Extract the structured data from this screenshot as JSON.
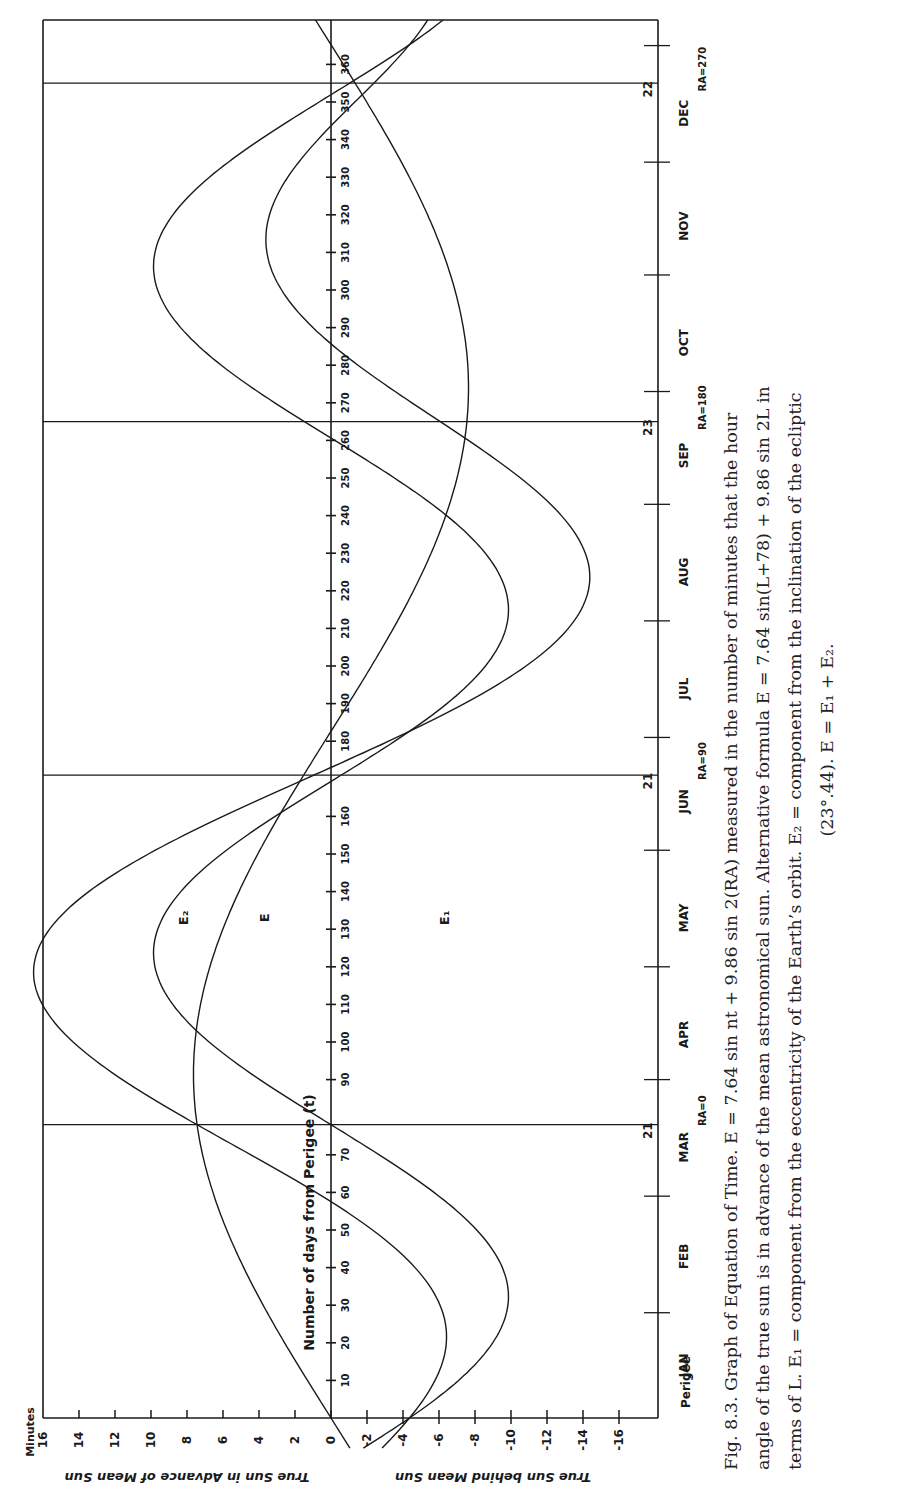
{
  "figure": {
    "label": "Fig. 8.3.",
    "title": "Graph of Equation of Time.",
    "caption_lines": [
      "Fig. 8.3.  Graph of Equation of Time.    E = 7.64 sin nt + 9.86 sin 2(RA) measured in the number of minutes that the hour",
      "angle of the true sun is in advance of the mean astronomical sun. Alternative formula   E = 7.64 sin(L+78) + 9.86 sin 2L in",
      "terms of L. E₁ = component from the eccentricity of the Earth’s orbit. E₂ = component from the inclination of the ecliptic",
      "(23°.44).  E = E₁ + E₂."
    ]
  },
  "axes": {
    "minutes_label": "Minutes",
    "minutes_ticks": [
      16,
      14,
      12,
      10,
      8,
      6,
      4,
      2,
      0,
      -2,
      -4,
      -6,
      -8,
      -10,
      -12,
      -14,
      -16
    ],
    "minutes_tick_labels": [
      "16",
      "14",
      "12",
      "10",
      "8",
      "6",
      "4",
      "2",
      "0",
      "-2",
      "-4",
      "-6",
      "-8",
      "-10",
      "-12",
      "-14",
      "-16"
    ],
    "advance_label": "True Sun in Advance of Mean Sun",
    "behind_label": "True Sun behind Mean Sun",
    "days_label": "Number of days from Perigee (t)",
    "day_ticks": [
      10,
      20,
      30,
      40,
      50,
      60,
      70,
      90,
      100,
      110,
      120,
      130,
      140,
      150,
      160,
      180,
      190,
      200,
      210,
      220,
      230,
      240,
      250,
      260,
      270,
      280,
      290,
      300,
      310,
      320,
      330,
      340,
      350,
      360
    ],
    "perigee_label": "Perigee"
  },
  "months": [
    {
      "label": "JAN",
      "day": 14
    },
    {
      "label": "FEB",
      "day": 43
    },
    {
      "label": "MAR",
      "day": 72
    },
    {
      "label": "APR",
      "day": 102
    },
    {
      "label": "MAY",
      "day": 133
    },
    {
      "label": "JUN",
      "day": 164
    },
    {
      "label": "JUL",
      "day": 194
    },
    {
      "label": "AUG",
      "day": 225
    },
    {
      "label": "SEP",
      "day": 256
    },
    {
      "label": "OCT",
      "day": 286
    },
    {
      "label": "NOV",
      "day": 317
    },
    {
      "label": "DEC",
      "day": 347
    }
  ],
  "month_boundaries": [
    28,
    59,
    90,
    120,
    151,
    181,
    212,
    243,
    273,
    304,
    334,
    365
  ],
  "cardinal_points": [
    {
      "date": "21",
      "ra_label": "RA=0",
      "day": 78
    },
    {
      "date": "21",
      "ra_label": "RA=90",
      "day": 171
    },
    {
      "date": "23",
      "ra_label": "RA=180",
      "day": 265
    },
    {
      "date": "22",
      "ra_label": "RA=270",
      "day": 355
    }
  ],
  "curve_labels": [
    {
      "label": "E₂",
      "day": 133,
      "minutes": 8.2
    },
    {
      "label": "E",
      "day": 133,
      "minutes": 3.7
    },
    {
      "label": "E₁",
      "day": 133,
      "minutes": -6.3
    }
  ],
  "chart_data": {
    "type": "line",
    "title": "Graph of Equation of Time",
    "xlabel": "Number of days from Perigee (t)",
    "ylabel": "Minutes (True Sun in Advance of Mean Sun / True Sun behind Mean Sun)",
    "xlim": [
      0,
      365
    ],
    "ylim": [
      -16,
      16
    ],
    "grid": false,
    "orientation": "rotated 90° (days run bottom-to-top, minutes positive to the left)",
    "x": [
      0,
      10,
      20,
      30,
      40,
      50,
      60,
      70,
      78,
      90,
      100,
      110,
      120,
      130,
      140,
      150,
      160,
      171,
      180,
      190,
      200,
      210,
      220,
      230,
      240,
      250,
      260,
      265,
      270,
      280,
      290,
      300,
      310,
      320,
      330,
      340,
      350,
      360
    ],
    "series": [
      {
        "name": "E1",
        "values": [
          0.0,
          1.3,
          2.6,
          3.7,
          4.7,
          5.6,
          6.3,
          6.9,
          7.2,
          7.5,
          7.6,
          7.6,
          7.4,
          7.0,
          6.5,
          5.8,
          5.0,
          4.0,
          3.1,
          2.0,
          0.9,
          -0.3,
          -1.6,
          -2.8,
          -3.9,
          -4.9,
          -5.8,
          -6.2,
          -6.5,
          -7.1,
          -7.5,
          -7.6,
          -7.5,
          -7.2,
          -6.7,
          -6.0,
          -5.2,
          -4.2
        ]
      },
      {
        "name": "E2",
        "values": [
          -2.6,
          -5.7,
          -8.1,
          -9.5,
          -9.8,
          -8.9,
          -6.9,
          -4.1,
          -1.5,
          2.2,
          5.2,
          7.7,
          9.3,
          9.9,
          9.3,
          7.6,
          5.1,
          1.7,
          -1.2,
          -4.4,
          -7.1,
          -9.0,
          -9.9,
          -9.6,
          -8.2,
          -5.9,
          -2.9,
          -1.2,
          0.5,
          3.7,
          6.6,
          8.7,
          9.8,
          9.7,
          8.4,
          6.2,
          3.2,
          -0.1
        ]
      },
      {
        "name": "E",
        "values": [
          -3.2,
          -7.1,
          -10.9,
          -13.2,
          -14.3,
          -14.0,
          -11.8,
          -7.6,
          -4.2,
          1.2,
          4.7,
          7.5,
          9.3,
          10.0,
          9.4,
          7.7,
          5.2,
          1.8,
          -1.0,
          -4.2,
          -6.9,
          -8.8,
          -9.9,
          -9.7,
          -8.4,
          -6.3,
          -3.4,
          -1.6,
          0.1,
          3.2,
          6.1,
          8.2,
          9.4,
          9.4,
          8.1,
          5.9,
          2.9,
          -0.4
        ]
      }
    ],
    "annotations": [
      "E₂",
      "E",
      "E₁",
      "21 MAR RA=0",
      "21 JUN RA=90",
      "23 SEP RA=180",
      "22 DEC RA=270",
      "Perigee",
      "Minutes"
    ]
  },
  "colors": {
    "ink": "#1a1a1a",
    "paper": "#ffffff",
    "caption": "#222222"
  }
}
